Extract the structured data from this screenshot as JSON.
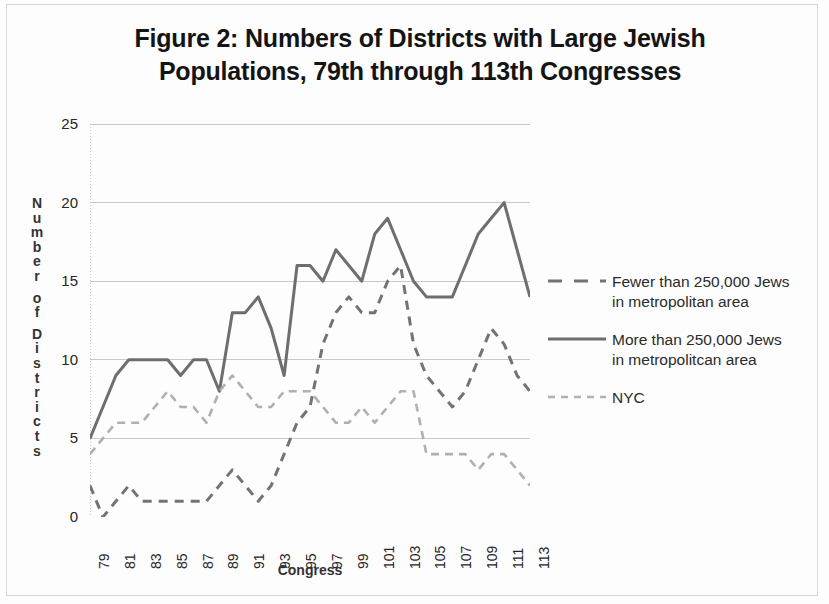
{
  "figure": {
    "title": "Figure 2:  Numbers of Districts with Large Jewish\nPopulations, 79th through 113th Congresses",
    "y_axis_title_letters": [
      "N",
      "u",
      "m",
      "b",
      "e",
      "r",
      "",
      "o",
      "f",
      "",
      "D",
      "i",
      "s",
      "t",
      "r",
      "i",
      "c",
      "t",
      "s"
    ],
    "x_axis_title": "Congress"
  },
  "legend": {
    "entries": [
      {
        "label": "Fewer than 250,000 Jews in metropolitan area",
        "style": "dashed",
        "color": "#737373"
      },
      {
        "label": "More than 250,000 Jews  in metropolitcan area",
        "style": "solid",
        "color": "#6e6e6e"
      },
      {
        "label": "NYC",
        "style": "dashed-light",
        "color": "#b0b0b0"
      }
    ]
  },
  "chart_data": {
    "type": "line",
    "title": "Figure 2:  Numbers of Districts with Large Jewish Populations, 79th through 113th Congresses",
    "xlabel": "Congress",
    "ylabel": "Number of Districts",
    "xlim": [
      79,
      113
    ],
    "ylim": [
      0,
      25
    ],
    "y_ticks": [
      0,
      5,
      10,
      15,
      20,
      25
    ],
    "x_ticks": [
      79,
      80,
      81,
      82,
      83,
      84,
      85,
      86,
      87,
      88,
      89,
      90,
      91,
      92,
      93,
      94,
      95,
      96,
      97,
      98,
      99,
      100,
      101,
      102,
      103,
      104,
      105,
      106,
      107,
      108,
      109,
      110,
      111,
      112,
      113
    ],
    "x_tick_labels": [
      "79",
      "",
      "81",
      "",
      "83",
      "",
      "85",
      "",
      "87",
      "",
      "89",
      "",
      "91",
      "",
      "93",
      "",
      "95",
      "",
      "97",
      "",
      "99",
      "",
      "101",
      "",
      "103",
      "",
      "105",
      "",
      "107",
      "",
      "109",
      "",
      "111",
      "",
      "113"
    ],
    "grid": "horizontal",
    "legend_position": "right",
    "x": [
      79,
      80,
      81,
      82,
      83,
      84,
      85,
      86,
      87,
      88,
      89,
      90,
      91,
      92,
      93,
      94,
      95,
      96,
      97,
      98,
      99,
      100,
      101,
      102,
      103,
      104,
      105,
      106,
      107,
      108,
      109,
      110,
      111,
      112,
      113
    ],
    "series": [
      {
        "name": "Fewer than 250,000 Jews in metropolitan area",
        "style": "dashed",
        "color": "#737373",
        "values": [
          2,
          0,
          1,
          2,
          1,
          1,
          1,
          1,
          1,
          1,
          2,
          3,
          2,
          1,
          2,
          4,
          6,
          7,
          11,
          13,
          14,
          13,
          13,
          15,
          16,
          11,
          9,
          8,
          7,
          8,
          10,
          12,
          11,
          9,
          8
        ]
      },
      {
        "name": "More than 250,000 Jews  in metropolitcan area",
        "style": "solid",
        "color": "#6e6e6e",
        "values": [
          5,
          7,
          9,
          10,
          10,
          10,
          10,
          9,
          10,
          10,
          8,
          13,
          13,
          14,
          12,
          9,
          16,
          16,
          15,
          17,
          16,
          15,
          18,
          19,
          17,
          15,
          14,
          14,
          14,
          16,
          18,
          19,
          20,
          17,
          14
        ]
      },
      {
        "name": "NYC",
        "style": "dashed-light",
        "color": "#b0b0b0",
        "values": [
          4,
          5,
          6,
          6,
          6,
          7,
          8,
          7,
          7,
          6,
          8,
          9,
          8,
          7,
          7,
          8,
          8,
          8,
          7,
          6,
          6,
          7,
          6,
          7,
          8,
          8,
          4,
          4,
          4,
          4,
          3,
          4,
          4,
          3,
          2
        ]
      }
    ]
  }
}
